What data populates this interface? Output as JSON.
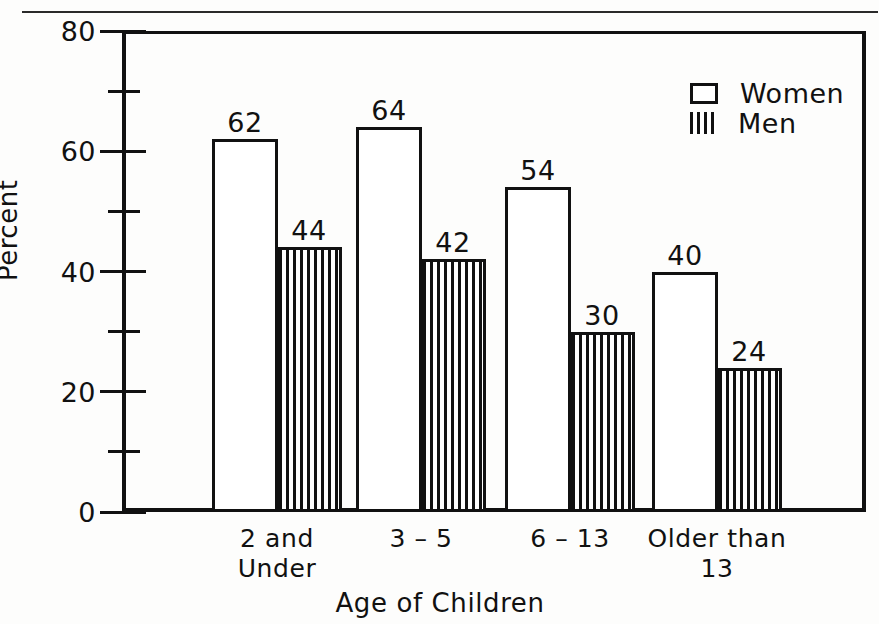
{
  "chart_data": {
    "type": "bar",
    "title": "",
    "xlabel": "Age of Children",
    "ylabel": "Percent",
    "ylim": [
      0,
      80
    ],
    "grid": false,
    "legend_position": "top-right",
    "categories": [
      "2 and\nUnder",
      "3 – 5",
      "6 – 13",
      "Older than\n13"
    ],
    "y_ticks_major": [
      "0",
      "20",
      "40",
      "60",
      "80"
    ],
    "y_ticks_major_values": [
      0,
      20,
      40,
      60,
      80
    ],
    "y_ticks_minor_values": [
      10,
      30,
      50,
      70
    ],
    "series": [
      {
        "name": "Women",
        "pattern": "open",
        "values": [
          62,
          64,
          54,
          40
        ],
        "labels": [
          "62",
          "64",
          "54",
          "40"
        ]
      },
      {
        "name": "Men",
        "pattern": "vertical-stripes",
        "values": [
          44,
          42,
          30,
          24
        ],
        "labels": [
          "44",
          "42",
          "30",
          "24"
        ]
      }
    ]
  },
  "legend": {
    "entries": [
      {
        "label": "Women",
        "swatch": "open-box-swatch"
      },
      {
        "label": "Men",
        "swatch": "striped-box-swatch"
      }
    ]
  },
  "axes": {
    "y_title": "Percent",
    "x_title": "Age of Children",
    "y_tick_labels": [
      "80",
      "60",
      "40",
      "20",
      "0"
    ]
  },
  "colors": {
    "ink": "#111111",
    "paper": "#fdfdfc"
  }
}
